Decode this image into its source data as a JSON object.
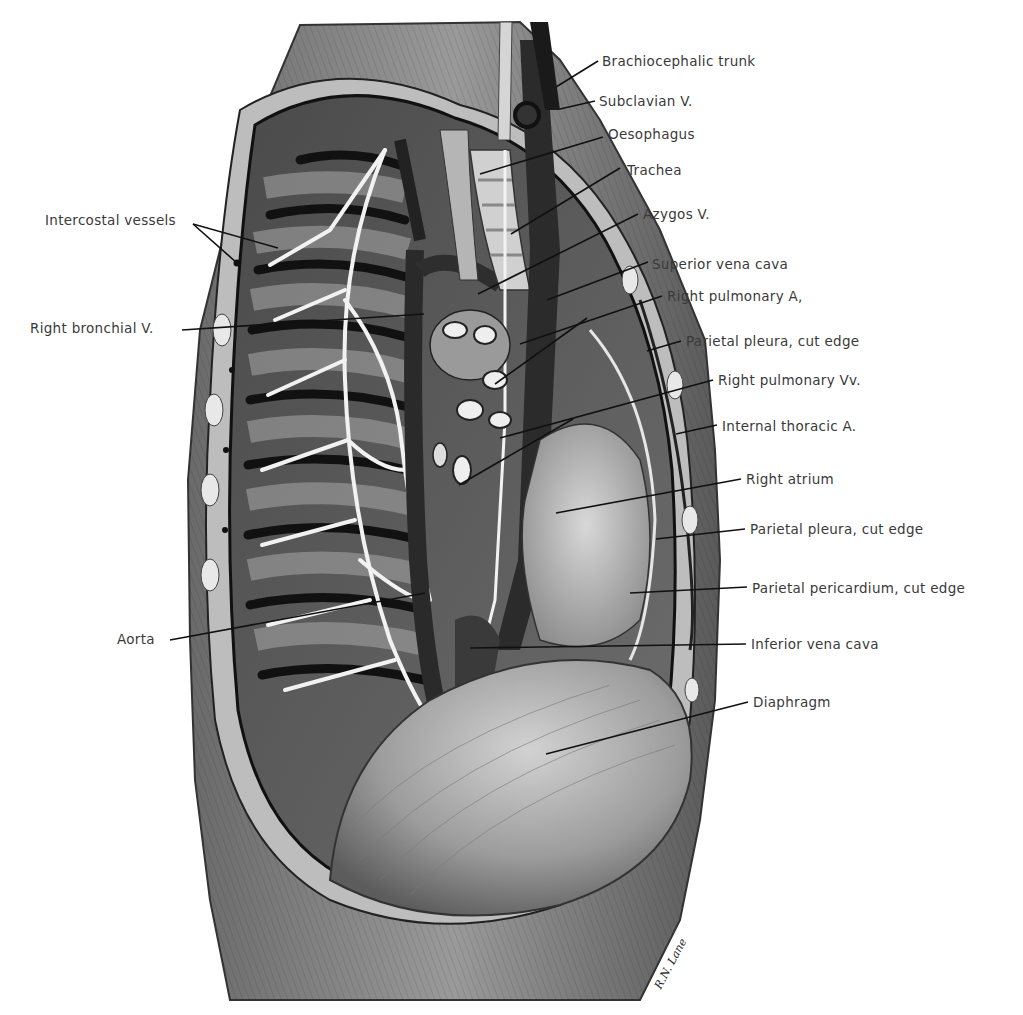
{
  "figure": {
    "signature": "R.N. Lane"
  },
  "labels": {
    "left": [
      {
        "id": "intercostal-vessels",
        "text": "Intercostal vessels",
        "x": 45,
        "y": 212
      },
      {
        "id": "right-bronchial-v",
        "text": "Right bronchial V.",
        "x": 30,
        "y": 320
      },
      {
        "id": "aorta",
        "text": "Aorta",
        "x": 117,
        "y": 631
      }
    ],
    "right": [
      {
        "id": "brachiocephalic-trunk",
        "text": "Brachiocephalic trunk",
        "x": 602,
        "y": 53
      },
      {
        "id": "subclavian-v",
        "text": "Subclavian V.",
        "x": 599,
        "y": 93
      },
      {
        "id": "oesophagus",
        "text": "Oesophagus",
        "x": 608,
        "y": 126
      },
      {
        "id": "trachea",
        "text": "Trachea",
        "x": 627,
        "y": 162
      },
      {
        "id": "azygos-v",
        "text": "Azygos V.",
        "x": 643,
        "y": 206
      },
      {
        "id": "superior-vena-cava",
        "text": "Superior vena cava",
        "x": 652,
        "y": 256
      },
      {
        "id": "right-pulmonary-a",
        "text": "Right pulmonary A,",
        "x": 667,
        "y": 288
      },
      {
        "id": "parietal-pleura-1",
        "text": "Parietal pleura, cut edge",
        "x": 686,
        "y": 333
      },
      {
        "id": "right-pulmonary-vv",
        "text": "Right pulmonary Vv.",
        "x": 718,
        "y": 372
      },
      {
        "id": "internal-thoracic-a",
        "text": "Internal thoracic A.",
        "x": 722,
        "y": 418
      },
      {
        "id": "right-atrium",
        "text": "Right atrium",
        "x": 746,
        "y": 471
      },
      {
        "id": "parietal-pleura-2",
        "text": "Parietal pleura, cut edge",
        "x": 750,
        "y": 521
      },
      {
        "id": "parietal-pericardium",
        "text": "Parietal pericardium, cut edge",
        "x": 752,
        "y": 580
      },
      {
        "id": "inferior-vena-cava",
        "text": "Inferior vena cava",
        "x": 751,
        "y": 636
      },
      {
        "id": "diaphragm",
        "text": "Diaphragm",
        "x": 753,
        "y": 694
      }
    ]
  },
  "leaders": [
    {
      "for": "brachiocephalic-trunk",
      "x1": 598,
      "y1": 61,
      "x2": 556,
      "y2": 87
    },
    {
      "for": "subclavian-v",
      "x1": 595,
      "y1": 101,
      "x2": 560,
      "y2": 109
    },
    {
      "for": "oesophagus",
      "x1": 603,
      "y1": 137,
      "x2": 480,
      "y2": 174
    },
    {
      "for": "trachea",
      "x1": 620,
      "y1": 168,
      "x2": 511,
      "y2": 234
    },
    {
      "for": "azygos-v",
      "x1": 638,
      "y1": 214,
      "x2": 478,
      "y2": 294
    },
    {
      "for": "superior-vena-cava",
      "x1": 648,
      "y1": 262,
      "x2": 547,
      "y2": 300
    },
    {
      "for": "right-pulmonary-a",
      "x1": 662,
      "y1": 296,
      "x2": 520,
      "y2": 344
    },
    {
      "for": "right-pulmonary-a-2",
      "x1": 587,
      "y1": 318,
      "x2": 495,
      "y2": 384
    },
    {
      "for": "parietal-pleura-1",
      "x1": 681,
      "y1": 341,
      "x2": 647,
      "y2": 351
    },
    {
      "for": "right-pulmonary-vv",
      "x1": 713,
      "y1": 380,
      "x2": 500,
      "y2": 438
    },
    {
      "for": "right-pulmonary-vv-2",
      "x1": 573,
      "y1": 419,
      "x2": 459,
      "y2": 485
    },
    {
      "for": "internal-thoracic-a",
      "x1": 717,
      "y1": 425,
      "x2": 676,
      "y2": 434
    },
    {
      "for": "right-atrium",
      "x1": 741,
      "y1": 479,
      "x2": 556,
      "y2": 513
    },
    {
      "for": "parietal-pleura-2",
      "x1": 745,
      "y1": 529,
      "x2": 656,
      "y2": 539
    },
    {
      "for": "parietal-pericardium",
      "x1": 747,
      "y1": 587,
      "x2": 630,
      "y2": 593
    },
    {
      "for": "inferior-vena-cava",
      "x1": 746,
      "y1": 644,
      "x2": 470,
      "y2": 648
    },
    {
      "for": "diaphragm",
      "x1": 748,
      "y1": 702,
      "x2": 546,
      "y2": 754
    },
    {
      "for": "intercostal-vessels",
      "x1": 193,
      "y1": 224,
      "x2": 278,
      "y2": 248
    },
    {
      "for": "intercostal-vessels-2",
      "x1": 193,
      "y1": 224,
      "x2": 237,
      "y2": 263
    },
    {
      "for": "right-bronchial-v",
      "x1": 182,
      "y1": 330,
      "x2": 424,
      "y2": 314
    },
    {
      "for": "aorta",
      "x1": 170,
      "y1": 640,
      "x2": 425,
      "y2": 593
    }
  ],
  "colors": {
    "background": "#ffffff",
    "label_text": "#3a3a3a",
    "leader": "#111111",
    "tissue_light": "#c8c8c8",
    "tissue_mid": "#8a8a8a",
    "tissue_dark": "#3c3c3c",
    "vessel_dark": "#1a1a1a",
    "nerve_white": "#f2f2f2"
  }
}
